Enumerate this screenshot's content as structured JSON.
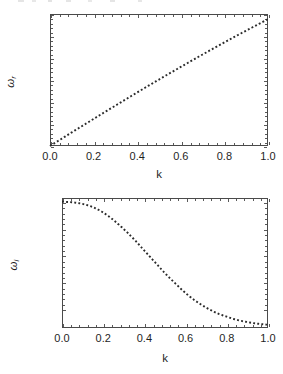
{
  "figure": {
    "background": "#ffffff",
    "ink": "#2b2b2b",
    "partial_text_top": ""
  },
  "chart_data": [
    {
      "id": "omega-real",
      "type": "line",
      "title": "",
      "xlabel": "k",
      "ylabel": "ω",
      "ylabel_sub": "r",
      "xlim": [
        0.0,
        1.0
      ],
      "ylim": [
        0.0,
        1.2
      ],
      "grid": false,
      "legend": null,
      "linestyle": "dotted",
      "color": "#2b2b2b",
      "xticks": [
        "0.0",
        "0.2",
        "0.4",
        "0.6",
        "0.8",
        "1.0"
      ],
      "xtick_values": [
        0.0,
        0.2,
        0.4,
        0.6,
        0.8,
        1.0
      ],
      "yticks": [
        "0.0",
        "0.2",
        "0.4",
        "0.6",
        "0.8",
        "1.0",
        "1.2"
      ],
      "ytick_values": [
        0.0,
        0.2,
        0.4,
        0.6,
        0.8,
        1.0,
        1.2
      ],
      "x": [
        0.0,
        0.05,
        0.1,
        0.15,
        0.2,
        0.25,
        0.3,
        0.35,
        0.4,
        0.45,
        0.5,
        0.55,
        0.6,
        0.65,
        0.7,
        0.75,
        0.8,
        0.85,
        0.9,
        0.95,
        1.0
      ],
      "values": [
        0.0,
        0.062,
        0.124,
        0.185,
        0.246,
        0.307,
        0.367,
        0.427,
        0.487,
        0.546,
        0.604,
        0.662,
        0.719,
        0.776,
        0.832,
        0.887,
        0.942,
        0.996,
        1.049,
        1.101,
        1.153
      ]
    },
    {
      "id": "omega-imag",
      "type": "line",
      "title": "",
      "xlabel": "k",
      "ylabel": "ω",
      "ylabel_sub": "i",
      "xlim": [
        0.0,
        1.0
      ],
      "ylim": [
        -0.01485,
        -0.01243
      ],
      "grid": false,
      "legend": null,
      "linestyle": "dotted",
      "color": "#2b2b2b",
      "xticks": [
        "0.0",
        "0.2",
        "0.4",
        "0.6",
        "0.8",
        "1.0"
      ],
      "xtick_values": [
        0.0,
        0.2,
        0.4,
        0.6,
        0.8,
        1.0
      ],
      "yticks": [
        "-0.0125",
        "-0.0130",
        "-0.0135",
        "-0.0140",
        "-0.0145"
      ],
      "ytick_values": [
        -0.0125,
        -0.013,
        -0.0135,
        -0.014,
        -0.0145
      ],
      "x": [
        0.0,
        0.05,
        0.1,
        0.15,
        0.2,
        0.25,
        0.3,
        0.35,
        0.4,
        0.45,
        0.5,
        0.55,
        0.6,
        0.65,
        0.7,
        0.75,
        0.8,
        0.85,
        0.9,
        0.95,
        1.0
      ],
      "values": [
        -0.0125,
        -0.01251,
        -0.01254,
        -0.0126,
        -0.0127,
        -0.01284,
        -0.01301,
        -0.0132,
        -0.01341,
        -0.01362,
        -0.01383,
        -0.01402,
        -0.0142,
        -0.01435,
        -0.01447,
        -0.01457,
        -0.01464,
        -0.0147,
        -0.01474,
        -0.01477,
        -0.01479
      ]
    }
  ]
}
